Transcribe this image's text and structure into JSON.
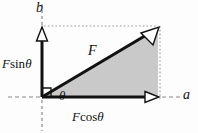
{
  "figure": {
    "labels": {
      "axis_b": "b",
      "axis_a": "a",
      "force": "F",
      "angle": "θ",
      "vertical_component_F": "F",
      "vertical_component_fn": "sin",
      "vertical_component_angle": "θ",
      "horizontal_component_F": "F",
      "horizontal_component_fn": "cos",
      "horizontal_component_angle": "θ",
      "vertical_component_full": "F sin θ",
      "horizontal_component_full": "F cos θ"
    },
    "colors": {
      "stroke": "#111111",
      "fill": "#c9c9c9",
      "guide": "#9a9a9a",
      "background": "#fdfdfd",
      "arrow_fill": "#ffffff"
    },
    "geometry": {
      "origin": [
        42,
        97
      ],
      "tip": [
        158,
        28
      ],
      "horizontal_end": [
        158,
        97
      ],
      "vertical_end": [
        42,
        28
      ],
      "angle_degrees": 31
    }
  }
}
